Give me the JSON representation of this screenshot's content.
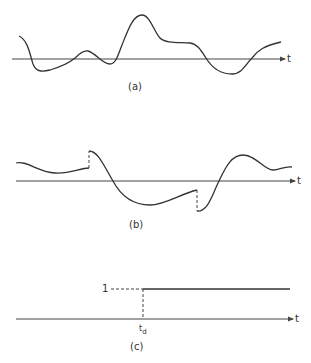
{
  "panels": [
    {
      "id": "a",
      "caption": "(a)",
      "axis_label": "t",
      "description": "random continuous waveform"
    },
    {
      "id": "b",
      "caption": "(b)",
      "axis_label": "t",
      "description": "waveform with two step discontinuities"
    },
    {
      "id": "c",
      "caption": "(c)",
      "axis_label": "t",
      "description": "unit step at t_d",
      "level_label": "1",
      "step_time_label": "t",
      "step_time_subscript": "d"
    }
  ]
}
